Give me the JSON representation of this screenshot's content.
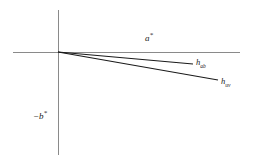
{
  "figure": {
    "background_color": "#ffffff",
    "axis_color": "#8a8a8a",
    "ray_color": "#1a1a1a",
    "width": 253,
    "height": 165
  },
  "axes": {
    "horizontal": {
      "name": "a-star-axis",
      "label_base": "a",
      "label_sup": "*",
      "x1": 13,
      "y1": 52,
      "x2": 240,
      "y2": 52
    },
    "vertical": {
      "name": "negative-b-star-axis",
      "label_prefix": "−",
      "label_base": "b",
      "label_sup": "*",
      "x1": 58,
      "y1": 10,
      "x2": 58,
      "y2": 155
    },
    "origin": {
      "x": 58,
      "y": 52
    }
  },
  "rays": [
    {
      "name": "hab-ray",
      "label_base": "h",
      "label_sub": "ab",
      "x1": 58,
      "y1": 52,
      "x2": 193,
      "y2": 64
    },
    {
      "name": "huv-ray",
      "label_base": "h",
      "label_sub": "uv",
      "x1": 58,
      "y1": 52,
      "x2": 218,
      "y2": 80
    }
  ]
}
